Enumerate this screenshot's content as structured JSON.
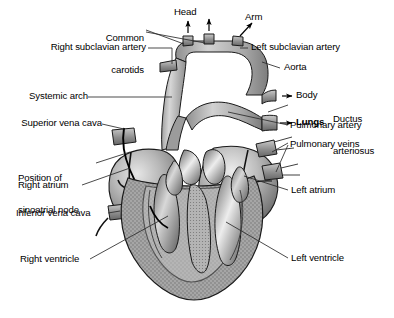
{
  "figure": {
    "background_color": "#ffffff",
    "ink_color": "#000000",
    "width": 394,
    "height": 318
  },
  "labels": {
    "common_carotids_l1": "Common",
    "common_carotids_l2": "carotids",
    "head": "Head",
    "arm": "Arm",
    "right_subclavian_artery": "Right subclavian artery",
    "left_subclavian_artery": "Left subclavian artery",
    "aorta": "Aorta",
    "body": "Body",
    "systemic_arch": "Systemic arch",
    "lungs": "Lungs",
    "ductus_l1": "Ductus",
    "ductus_l2": "arteriosus",
    "superior_vena_cava": "Superior vena cava",
    "pulmonary_artery": "Pulmonary artery",
    "pulmonary_veins": "Pulmonary veins",
    "position_of_l1": "Position of",
    "position_of_l2": "sinoatrial node",
    "right_atrium": "Right atrium",
    "left_atrium": "Left atrium",
    "inferior_vena_cava": "Inferior vena cava",
    "right_ventricle": "Right ventricle",
    "left_ventricle": "Left ventricle"
  },
  "palette": {
    "vessel_light": "#c9c9c9",
    "vessel_mid": "#a8a8a8",
    "vessel_dark": "#7a7a7a",
    "atrium_light": "#c4c4c4",
    "atrium_mid": "#9b9b9b",
    "atrium_dark": "#6f6f6f",
    "myocardium": "#9e9e9e",
    "chamber_light": "#e2e2e2",
    "outline": "#1a1a1a",
    "leader": "#2b2b2b"
  }
}
